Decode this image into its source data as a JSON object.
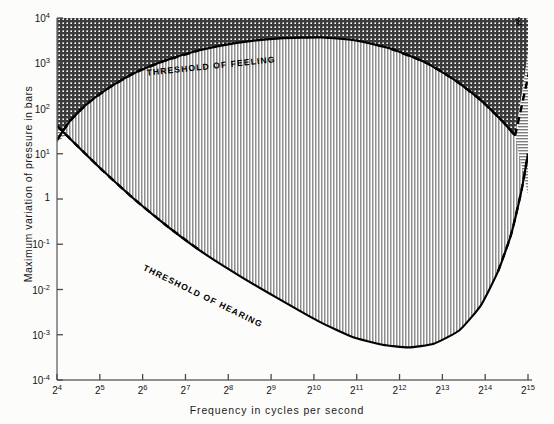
{
  "chart_data": {
    "type": "area",
    "title": "",
    "xlabel": "Frequency in cycles per second",
    "ylabel": "Maximum variation of pressure in bars",
    "xtick_labels": [
      "2",
      "2",
      "2",
      "2",
      "2",
      "2",
      "2",
      "2",
      "2",
      "2",
      "2",
      "2"
    ],
    "xtick_exponents": [
      "4",
      "5",
      "6",
      "7",
      "8",
      "9",
      "10",
      "11",
      "12",
      "13",
      "14",
      "15"
    ],
    "xtick_values": [
      16,
      32,
      64,
      128,
      256,
      512,
      1024,
      2048,
      4096,
      8192,
      16384,
      32768
    ],
    "ytick_labels": [
      "10",
      "10",
      "10",
      "10",
      "1",
      "10",
      "10",
      "10",
      "10"
    ],
    "ytick_exponents": [
      "4",
      "3",
      "2",
      "1",
      "",
      "-1",
      "-2",
      "-3",
      "-4"
    ],
    "ytick_values": [
      10000,
      1000,
      100,
      10,
      1,
      0.1,
      0.01,
      0.001,
      0.0001
    ],
    "xlim_log2": [
      4,
      15
    ],
    "ylim_log10": [
      -4,
      4
    ],
    "grid": false,
    "legend": "none",
    "annotations": [
      {
        "text": "THRESHOLD OF FEELING",
        "x_log2": 7.6,
        "y_log10": 2.95
      },
      {
        "text": "THRESHOLD OF HEARING",
        "x_log2": 7.4,
        "y_log10": -2.15
      }
    ],
    "series": [
      {
        "name": "Threshold of feeling",
        "style": "solid-and-dashed",
        "points": [
          {
            "x_log2": 4.0,
            "y_log10": 1.3
          },
          {
            "x_log2": 4.3,
            "y_log10": 1.72
          },
          {
            "x_log2": 4.7,
            "y_log10": 2.1
          },
          {
            "x_log2": 5.2,
            "y_log10": 2.45
          },
          {
            "x_log2": 5.8,
            "y_log10": 2.78
          },
          {
            "x_log2": 6.5,
            "y_log10": 3.05
          },
          {
            "x_log2": 7.3,
            "y_log10": 3.28
          },
          {
            "x_log2": 8.2,
            "y_log10": 3.45
          },
          {
            "x_log2": 9.2,
            "y_log10": 3.55
          },
          {
            "x_log2": 10.2,
            "y_log10": 3.57
          },
          {
            "x_log2": 11.0,
            "y_log10": 3.5
          },
          {
            "x_log2": 11.8,
            "y_log10": 3.32
          },
          {
            "x_log2": 12.6,
            "y_log10": 3.02
          },
          {
            "x_log2": 13.3,
            "y_log10": 2.62
          },
          {
            "x_log2": 13.9,
            "y_log10": 2.18
          },
          {
            "x_log2": 14.4,
            "y_log10": 1.72
          },
          {
            "x_log2": 14.7,
            "y_log10": 1.4
          }
        ]
      },
      {
        "name": "Threshold of hearing",
        "style": "solid-and-dashed",
        "points": [
          {
            "x_log2": 4.0,
            "y_log10": 1.62
          },
          {
            "x_log2": 4.5,
            "y_log10": 1.15
          },
          {
            "x_log2": 5.1,
            "y_log10": 0.6
          },
          {
            "x_log2": 5.8,
            "y_log10": 0.0
          },
          {
            "x_log2": 6.6,
            "y_log10": -0.62
          },
          {
            "x_log2": 7.4,
            "y_log10": -1.18
          },
          {
            "x_log2": 8.3,
            "y_log10": -1.72
          },
          {
            "x_log2": 9.2,
            "y_log10": -2.22
          },
          {
            "x_log2": 10.1,
            "y_log10": -2.7
          },
          {
            "x_log2": 10.9,
            "y_log10": -3.05
          },
          {
            "x_log2": 11.6,
            "y_log10": -3.22
          },
          {
            "x_log2": 12.2,
            "y_log10": -3.28
          },
          {
            "x_log2": 12.8,
            "y_log10": -3.2
          },
          {
            "x_log2": 13.4,
            "y_log10": -2.9
          },
          {
            "x_log2": 13.9,
            "y_log10": -2.35
          },
          {
            "x_log2": 14.3,
            "y_log10": -1.6
          },
          {
            "x_log2": 14.6,
            "y_log10": -0.8
          },
          {
            "x_log2": 14.85,
            "y_log10": 0.2
          },
          {
            "x_log2": 15.0,
            "y_log10": 1.0
          }
        ]
      }
    ]
  }
}
